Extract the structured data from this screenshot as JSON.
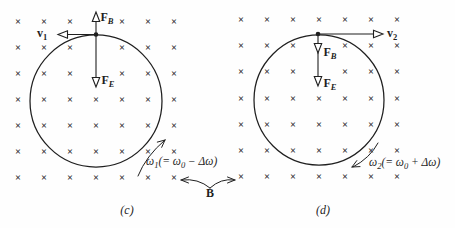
{
  "figure": {
    "background": "#fefefe",
    "ink_color": "#1f1f1f",
    "marker_color": "#272727",
    "field_symbol": "×",
    "b_label": "B",
    "panels": {
      "c": {
        "caption": "(c)",
        "velocity": {
          "base": "v",
          "sub": "1"
        },
        "force_magnetic": {
          "base": "F",
          "sub": "B"
        },
        "force_electric": {
          "base": "F",
          "sub": "E"
        },
        "omega": {
          "base": "ω",
          "sub": "1",
          "pre": "(= ",
          "w0": "ω",
          "w0sub": "0",
          "post": " − Δω)"
        }
      },
      "d": {
        "caption": "(d)",
        "velocity": {
          "base": "v",
          "sub": "2"
        },
        "force_magnetic": {
          "base": "F",
          "sub": "B"
        },
        "force_electric": {
          "base": "F",
          "sub": "E"
        },
        "omega": {
          "base": "ω",
          "sub": "2",
          "pre": "(= ",
          "w0": "ω",
          "w0sub": "0",
          "post": " + Δω)"
        }
      }
    },
    "field_grid": {
      "panels": [
        {
          "id": "c",
          "x0": 18,
          "y0": 23,
          "dx": 26,
          "dy": 26,
          "cols": 7,
          "rows": 7,
          "omit": [
            [
              3,
              0
            ],
            [
              3,
              1
            ],
            [
              3,
              2
            ]
          ]
        },
        {
          "id": "d",
          "x0": 241,
          "y0": 21,
          "dx": 26,
          "dy": 26.2,
          "cols": 7,
          "rows": 7,
          "omit": [
            [
              3,
              1
            ],
            [
              3,
              2
            ]
          ]
        }
      ]
    }
  }
}
